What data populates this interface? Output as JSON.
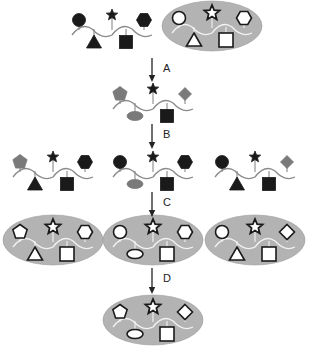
{
  "diagram": {
    "colors": {
      "dark": "#1a1a1a",
      "gray": "#7a7a7a",
      "oval_fill": "#b3b3b3",
      "backbone_bare": "#8a8a8a",
      "backbone_oval": "#f2f2f2",
      "outline_shape_fill": "#ffffff"
    },
    "steps": [
      {
        "id": "A",
        "label": "A"
      },
      {
        "id": "B",
        "label": "B"
      },
      {
        "id": "C",
        "label": "C"
      },
      {
        "id": "D",
        "label": "D"
      }
    ],
    "rows": [
      {
        "name": "row-1",
        "molecules": [
          {
            "name": "start-molecule-bare",
            "style": "bare",
            "cx": 112,
            "cy": 28,
            "top": [
              "circle-dark",
              "star-dark",
              "hexagon-dark"
            ],
            "bottom": [
              "triangle-dark",
              "square-dark"
            ]
          },
          {
            "name": "start-molecule-oval",
            "style": "oval",
            "cx": 212,
            "cy": 26,
            "top": [
              "circle",
              "star",
              "hexagon"
            ],
            "bottom": [
              "triangle",
              "square"
            ]
          }
        ]
      },
      {
        "name": "row-2",
        "molecules": [
          {
            "name": "after-A-molecule",
            "style": "bare",
            "cx": 153,
            "cy": 102,
            "top": [
              "pentagon-gray",
              "star-dark",
              "diamond-gray"
            ],
            "bottom": [
              "ellipse-gray",
              "square-dark"
            ]
          }
        ]
      },
      {
        "name": "row-3",
        "molecules": [
          {
            "name": "after-B-left-molecule",
            "style": "bare",
            "cx": 53,
            "cy": 170,
            "top": [
              "pentagon-gray",
              "star-dark",
              "hexagon-dark"
            ],
            "bottom": [
              "triangle-dark",
              "square-dark"
            ]
          },
          {
            "name": "after-B-center-molecule",
            "style": "bare",
            "cx": 153,
            "cy": 170,
            "top": [
              "circle-dark",
              "star-dark",
              "hexagon-dark"
            ],
            "bottom": [
              "ellipse-gray",
              "square-dark"
            ]
          },
          {
            "name": "after-B-right-molecule",
            "style": "bare",
            "cx": 255,
            "cy": 170,
            "top": [
              "circle-dark",
              "star-dark",
              "diamond-gray"
            ],
            "bottom": [
              "triangle-dark",
              "square-dark"
            ]
          }
        ]
      },
      {
        "name": "row-4",
        "molecules": [
          {
            "name": "after-C-left-oval",
            "style": "oval",
            "cx": 53,
            "cy": 240,
            "top": [
              "pentagon",
              "star",
              "hexagon"
            ],
            "bottom": [
              "triangle",
              "square"
            ]
          },
          {
            "name": "after-C-center-oval",
            "style": "oval",
            "cx": 153,
            "cy": 240,
            "top": [
              "circle",
              "star",
              "hexagon"
            ],
            "bottom": [
              "ellipse",
              "square"
            ]
          },
          {
            "name": "after-C-right-oval",
            "style": "oval",
            "cx": 255,
            "cy": 240,
            "top": [
              "circle",
              "star",
              "diamond"
            ],
            "bottom": [
              "triangle",
              "square"
            ]
          }
        ]
      },
      {
        "name": "row-5",
        "molecules": [
          {
            "name": "after-D-oval",
            "style": "oval",
            "cx": 153,
            "cy": 320,
            "top": [
              "pentagon",
              "star",
              "diamond"
            ],
            "bottom": [
              "ellipse",
              "square"
            ]
          }
        ]
      }
    ],
    "arrows": [
      {
        "name": "arrow-A",
        "x": 152,
        "y1": 58,
        "y2": 82,
        "label_x": 163,
        "label_y": 62,
        "step": 0
      },
      {
        "name": "arrow-B",
        "x": 152,
        "y1": 124,
        "y2": 149,
        "label_x": 163,
        "label_y": 128,
        "step": 1
      },
      {
        "name": "arrow-C",
        "x": 152,
        "y1": 192,
        "y2": 217,
        "label_x": 163,
        "label_y": 196,
        "step": 2
      },
      {
        "name": "arrow-D",
        "x": 152,
        "y1": 268,
        "y2": 294,
        "label_x": 163,
        "label_y": 272,
        "step": 3
      }
    ]
  }
}
